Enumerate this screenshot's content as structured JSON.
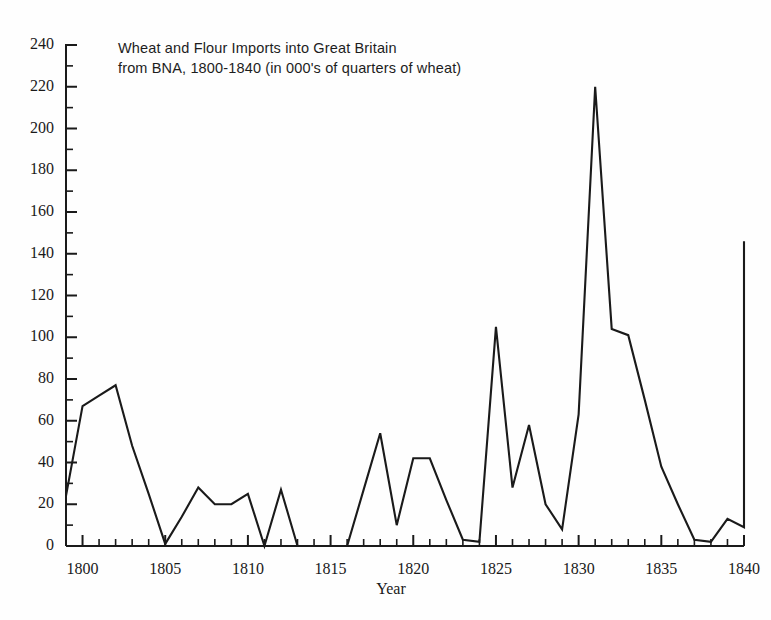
{
  "figure": {
    "background_color": "#fefefe",
    "line_color": "#1a1a1a",
    "axis_color": "#1a1a1a"
  },
  "chart_data": {
    "type": "line",
    "title": "Wheat and Flour Imports into Great Britain\nfrom BNA, 1800-1840 (in 000's of quarters of wheat)",
    "title_line1": "Wheat and Flour Imports into Great Britain",
    "title_line2": "from BNA, 1800-1840 (in 000's of quarters of wheat)",
    "xlabel": "Year",
    "ylabel": "",
    "xlim": [
      1799,
      1840
    ],
    "ylim": [
      0,
      240
    ],
    "grid": false,
    "legend": false,
    "y_ticks_major": [
      0,
      20,
      40,
      60,
      80,
      100,
      120,
      140,
      160,
      180,
      200,
      220,
      240
    ],
    "y_ticks_minor_step": 10,
    "x_ticks_major": [
      1800,
      1805,
      1810,
      1815,
      1820,
      1825,
      1830,
      1835,
      1840
    ],
    "x_ticks_minor_step": 1,
    "y_tick_labels": [
      "0",
      "20",
      "40",
      "60",
      "80",
      "100",
      "120",
      "140",
      "160",
      "180",
      "200",
      "220",
      "240"
    ],
    "x_tick_labels": [
      "1800",
      "1805",
      "1810",
      "1815",
      "1820",
      "1825",
      "1830",
      "1835",
      "1840"
    ],
    "x": [
      1799,
      1800,
      1801,
      1802,
      1803,
      1804,
      1805,
      1806,
      1807,
      1808,
      1809,
      1810,
      1811,
      1812,
      1813,
      1814,
      1815,
      1816,
      1817,
      1818,
      1819,
      1820,
      1821,
      1822,
      1823,
      1824,
      1825,
      1826,
      1827,
      1828,
      1829,
      1830,
      1831,
      1832,
      1833,
      1834,
      1835,
      1836,
      1837,
      1838,
      1839,
      1840
    ],
    "values": [
      24,
      67,
      72,
      77,
      48,
      25,
      1,
      14,
      28,
      20,
      20,
      25,
      0,
      27,
      0,
      0,
      0,
      0,
      27,
      54,
      10,
      42,
      42,
      22,
      3,
      2,
      105,
      28,
      58,
      20,
      8,
      63,
      220,
      104,
      101,
      70,
      38,
      20,
      3,
      2,
      13,
      9
    ],
    "series": [
      {
        "name": "Wheat and Flour Imports",
        "x": [
          1799,
          1800,
          1801,
          1802,
          1803,
          1804,
          1805,
          1806,
          1807,
          1808,
          1809,
          1810,
          1811,
          1812,
          1813,
          1814,
          1815,
          1816,
          1817,
          1818,
          1819,
          1820,
          1821,
          1822,
          1823,
          1824,
          1825,
          1826,
          1827,
          1828,
          1829,
          1830,
          1831,
          1832,
          1833,
          1834,
          1835,
          1836,
          1837,
          1838,
          1839,
          1840
        ],
        "values": [
          24,
          67,
          72,
          77,
          48,
          25,
          1,
          14,
          28,
          20,
          20,
          25,
          0,
          27,
          0,
          0,
          0,
          0,
          27,
          54,
          10,
          42,
          42,
          22,
          3,
          2,
          105,
          28,
          58,
          20,
          8,
          63,
          220,
          104,
          101,
          70,
          38,
          20,
          3,
          2,
          13,
          9
        ],
        "final_value": 146
      }
    ]
  }
}
